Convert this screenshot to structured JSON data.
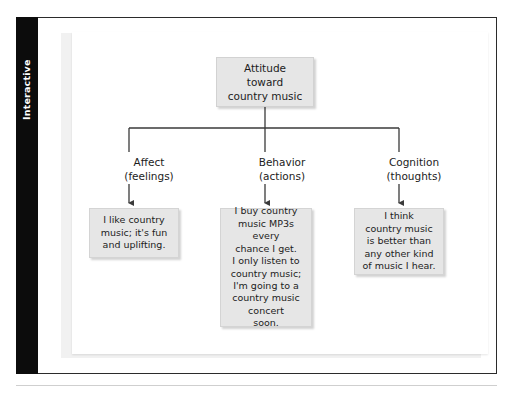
{
  "side_tab": {
    "label": "Interactive"
  },
  "diagram": {
    "title": "Attitude toward country music tripartite model",
    "root": {
      "text": "Attitude\ntoward\ncountry music"
    },
    "branches": [
      {
        "label": "Affect\n(feelings)",
        "content": "I like country\nmusic; it's fun\nand uplifting."
      },
      {
        "label": "Behavior\n(actions)",
        "content": "I buy country\nmusic MP3s every\nchance I get.\nI only listen to\ncountry music;\nI'm going to a\ncountry music\nconcert\nsoon."
      },
      {
        "label": "Cognition\n(thoughts)",
        "content": "I think\ncountry music\nis better than\nany other kind\nof music I hear."
      }
    ],
    "colors": {
      "box_fill": "#e6e6e6",
      "box_border": "#d4d4d4",
      "connector": "#3a3a3a",
      "tab_background": "#0c0c0c",
      "tab_text": "#ffffff"
    }
  }
}
